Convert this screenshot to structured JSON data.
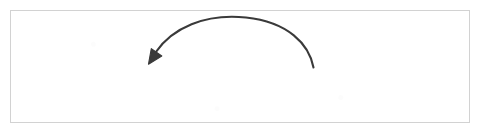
{
  "figure": {
    "kind": "grammar-recursion-diagram",
    "border_color": "#d2d2d2",
    "background_color": "#ffffff",
    "text_color": "#2b2b2b"
  },
  "grammar": {
    "line1_code": "List = [Element | List]",
    "line1_conjunction": "or",
    "line2_code": "[]",
    "tokens": {
      "nonterminal_head": "List",
      "assign_operator": "=",
      "open_bracket": "[",
      "element": "Element",
      "alternation_separator": "|",
      "recursive_reference": "List",
      "close_bracket": "]",
      "empty_list": "[]"
    }
  },
  "annotation": {
    "arrow": {
      "name": "recursion-arrow",
      "description": "curved arc from the recursive List reference back to the List definition head",
      "color": "#3a3a3a",
      "stroke_width": 2,
      "start_x": 313,
      "start_y": 67,
      "apex_x": 234,
      "apex_y": 17,
      "end_x": 149,
      "end_y": 63,
      "arrowhead": "solid-triangle",
      "arrowhead_direction": "down-left"
    }
  }
}
